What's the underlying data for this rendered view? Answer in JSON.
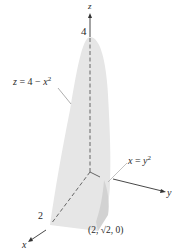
{
  "figure": {
    "type": "3d-region",
    "colors": {
      "surface_fill": "#e6e6e6",
      "surface_shade": "#d4d4d4",
      "axis": "#333333",
      "text": "#2a2a2a",
      "leader": "#888888"
    }
  },
  "axes": {
    "z": {
      "label": "z",
      "tick_label": "4"
    },
    "y": {
      "label": "y"
    },
    "x": {
      "label": "x",
      "tick_label": "2"
    }
  },
  "annotations": {
    "top_surface": {
      "lhs": "z",
      "eq": " = 4 − ",
      "var": "x",
      "exp": "2"
    },
    "side_surface": {
      "lhs": "x",
      "eq": " = ",
      "var": "y",
      "exp": "2"
    },
    "corner_point": "(2, √2, 0)"
  }
}
